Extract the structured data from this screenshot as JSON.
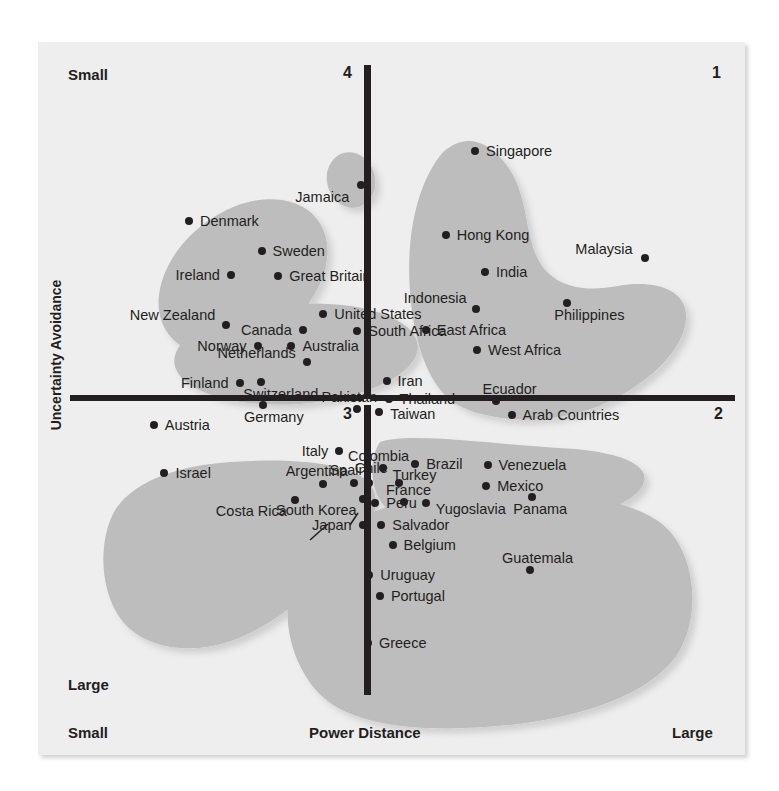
{
  "chart_data": {
    "type": "scatter",
    "title": "",
    "xlabel": "Power Distance",
    "ylabel": "Uncertainty Avoidance",
    "xlim": [
      0,
      100
    ],
    "ylim": [
      0,
      100
    ],
    "grid": false,
    "legend": null,
    "axis_end_labels": {
      "y_top": "Small",
      "y_bottom": "Large",
      "x_left": "Small",
      "x_right": "Large"
    },
    "quadrant_labels": [
      "1",
      "2",
      "3",
      "4"
    ],
    "quadrants": {
      "top_right": "1",
      "bottom_right": "2",
      "bottom_left": "3",
      "top_left": "4"
    },
    "points": [
      {
        "label": "Jamaica",
        "x": 43.8,
        "y": 19.0,
        "side": "r",
        "dx": -12,
        "dy": 12
      },
      {
        "label": "Denmark",
        "x": 17.9,
        "y": 24.8,
        "side": "l",
        "dx": 11,
        "dy": 0
      },
      {
        "label": "Sweden",
        "x": 28.8,
        "y": 29.5,
        "side": "l",
        "dx": 11,
        "dy": 0
      },
      {
        "label": "Ireland",
        "x": 24.2,
        "y": 33.3,
        "side": "r",
        "dx": -11,
        "dy": 0
      },
      {
        "label": "Great Britain",
        "x": 31.3,
        "y": 33.5,
        "side": "l",
        "dx": 11,
        "dy": 0
      },
      {
        "label": "New Zealand",
        "x": 23.5,
        "y": 41.3,
        "side": "r",
        "dx": -11,
        "dy": -10
      },
      {
        "label": "United States",
        "x": 38.1,
        "y": 39.5,
        "side": "l",
        "dx": 11,
        "dy": 0
      },
      {
        "label": "Canada",
        "x": 35.0,
        "y": 42.0,
        "side": "r",
        "dx": -11,
        "dy": 0
      },
      {
        "label": "South Africa",
        "x": 43.2,
        "y": 42.3,
        "side": "l",
        "dx": 11,
        "dy": 0
      },
      {
        "label": "Norway",
        "x": 28.2,
        "y": 44.6,
        "side": "r",
        "dx": -11,
        "dy": 0
      },
      {
        "label": "Australia",
        "x": 33.3,
        "y": 44.6,
        "side": "l",
        "dx": 11,
        "dy": 0
      },
      {
        "label": "Netherlands",
        "x": 35.6,
        "y": 47.2,
        "side": "r",
        "dx": -11,
        "dy": -9
      },
      {
        "label": "Singapore",
        "x": 60.9,
        "y": 13.6,
        "side": "l",
        "dx": 11,
        "dy": 0
      },
      {
        "label": "Hong Kong",
        "x": 56.5,
        "y": 27.0,
        "side": "l",
        "dx": 11,
        "dy": 0
      },
      {
        "label": "Malaysia",
        "x": 86.4,
        "y": 30.6,
        "side": "r",
        "dx": -12,
        "dy": -9
      },
      {
        "label": "India",
        "x": 62.4,
        "y": 32.9,
        "side": "l",
        "dx": 11,
        "dy": 0
      },
      {
        "label": "Indonesia",
        "x": 61.0,
        "y": 38.8,
        "side": "r",
        "dx": -9,
        "dy": -11
      },
      {
        "label": "Philippines",
        "x": 74.8,
        "y": 37.8,
        "side": "c",
        "dx": 22,
        "dy": 12
      },
      {
        "label": "East Africa",
        "x": 53.5,
        "y": 42.1,
        "side": "l",
        "dx": 11,
        "dy": 0
      },
      {
        "label": "West Africa",
        "x": 61.2,
        "y": 45.2,
        "side": "l",
        "dx": 11,
        "dy": 0
      },
      {
        "label": "Finland",
        "x": 25.5,
        "y": 50.4,
        "side": "r",
        "dx": -11,
        "dy": 0
      },
      {
        "label": "Switzerland",
        "x": 28.7,
        "y": 50.3,
        "side": "c",
        "dx": 20,
        "dy": 12
      },
      {
        "label": "Germany",
        "x": 29.0,
        "y": 54.0,
        "side": "c",
        "dx": 11,
        "dy": 12
      },
      {
        "label": "Austria",
        "x": 12.6,
        "y": 57.1,
        "side": "l",
        "dx": 11,
        "dy": 0
      },
      {
        "label": "Israel",
        "x": 14.2,
        "y": 64.7,
        "side": "l",
        "dx": 11,
        "dy": 0
      },
      {
        "label": "Iran",
        "x": 47.6,
        "y": 50.1,
        "side": "l",
        "dx": 11,
        "dy": 0
      },
      {
        "label": "Pakistan",
        "x": 43.2,
        "y": 54.6,
        "side": "c",
        "dx": -8,
        "dy": -12
      },
      {
        "label": "Thailand",
        "x": 47.9,
        "y": 53.0,
        "side": "l",
        "dx": 11,
        "dy": 0
      },
      {
        "label": "Taiwan",
        "x": 46.5,
        "y": 55.0,
        "side": "l",
        "dx": 11,
        "dy": 2
      },
      {
        "label": "Ecuador",
        "x": 64.0,
        "y": 53.4,
        "side": "c",
        "dx": 14,
        "dy": -12
      },
      {
        "label": "Arab Countries",
        "x": 66.4,
        "y": 55.5,
        "side": "l",
        "dx": 11,
        "dy": 0
      },
      {
        "label": "Italy",
        "x": 40.5,
        "y": 61.3,
        "side": "r",
        "dx": -11,
        "dy": 0
      },
      {
        "label": "Colombia",
        "x": 47.0,
        "y": 63.9,
        "side": "c",
        "dx": -4,
        "dy": -12
      },
      {
        "label": "Brazil",
        "x": 51.9,
        "y": 63.3,
        "side": "l",
        "dx": 11,
        "dy": 0
      },
      {
        "label": "Venezuela",
        "x": 62.8,
        "y": 63.5,
        "side": "l",
        "dx": 11,
        "dy": 0
      },
      {
        "label": "Argentina",
        "x": 38.0,
        "y": 66.5,
        "side": "c",
        "dx": -6,
        "dy": -13
      },
      {
        "label": "Spain",
        "x": 42.7,
        "y": 66.4,
        "side": "c",
        "dx": -6,
        "dy": -13
      },
      {
        "label": "Chile",
        "x": 45.0,
        "y": 66.4,
        "side": "c",
        "dx": 2,
        "dy": -15
      },
      {
        "label": "Turkey",
        "x": 49.4,
        "y": 66.3,
        "side": "c",
        "dx": 16,
        "dy": -8
      },
      {
        "label": "Mexico",
        "x": 62.6,
        "y": 66.9,
        "side": "l",
        "dx": 11,
        "dy": 0
      },
      {
        "label": "South Korea",
        "x": 44.0,
        "y": 68.9,
        "side": "r",
        "dx": -6,
        "dy": 11
      },
      {
        "label": "Peru",
        "x": 45.9,
        "y": 69.5,
        "side": "l",
        "dx": 11,
        "dy": 0
      },
      {
        "label": "France",
        "x": 50.3,
        "y": 69.3,
        "side": "c",
        "dx": 4,
        "dy": -12
      },
      {
        "label": "Yugoslavia",
        "x": 53.5,
        "y": 69.6,
        "side": "l",
        "dx": 10,
        "dy": 6
      },
      {
        "label": "Panama",
        "x": 69.5,
        "y": 68.6,
        "side": "c",
        "dx": 8,
        "dy": 12
      },
      {
        "label": "Salvador",
        "x": 46.8,
        "y": 73.0,
        "side": "l",
        "dx": 11,
        "dy": 0
      },
      {
        "label": "Belgium",
        "x": 48.5,
        "y": 76.2,
        "side": "l",
        "dx": 11,
        "dy": 0
      },
      {
        "label": "Japan",
        "x": 44.0,
        "y": 73.0,
        "side": "r",
        "dx": -11,
        "dy": 0
      },
      {
        "label": "Costa Rica",
        "x": 33.8,
        "y": 69.0,
        "side": "r",
        "dx": -8,
        "dy": 11
      },
      {
        "label": "Uruguay",
        "x": 45.0,
        "y": 81.0,
        "side": "l",
        "dx": 11,
        "dy": 0
      },
      {
        "label": "Portugal",
        "x": 46.6,
        "y": 84.3,
        "side": "l",
        "dx": 11,
        "dy": 0
      },
      {
        "label": "Guatemala",
        "x": 69.1,
        "y": 80.1,
        "side": "c",
        "dx": 8,
        "dy": -12
      },
      {
        "label": "Greece",
        "x": 44.8,
        "y": 91.7,
        "side": "l",
        "dx": 11,
        "dy": 0
      }
    ]
  }
}
